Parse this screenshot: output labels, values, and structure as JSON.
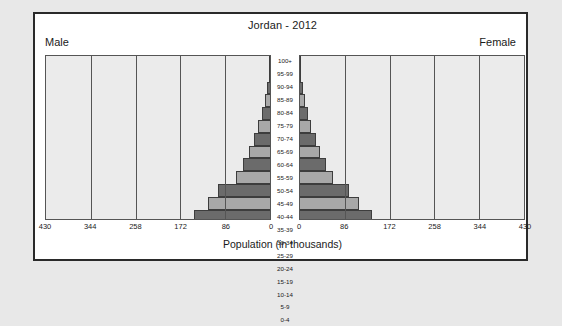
{
  "chart_data": {
    "type": "bar",
    "subtype": "population-pyramid",
    "title": "Jordan - 2012",
    "xlabel": "Population (in thousands)",
    "ylabel": "",
    "left_series_label": "Male",
    "right_series_label": "Female",
    "categories": [
      "100+",
      "95-99",
      "90-94",
      "85-89",
      "80-84",
      "75-79",
      "70-74",
      "65-69",
      "60-64",
      "55-59",
      "50-54",
      "45-49",
      "40-44",
      "35-39",
      "30-34",
      "25-29",
      "20-24",
      "15-19",
      "10-14",
      "5-9",
      "0-4"
    ],
    "xlim": [
      0,
      430
    ],
    "xticks": [
      0,
      86,
      172,
      258,
      344,
      430
    ],
    "xtick_labels_left": [
      "430",
      "344",
      "258",
      "172",
      "86",
      "0"
    ],
    "xtick_labels_right": [
      "0",
      "86",
      "172",
      "258",
      "344",
      "430"
    ],
    "grid": true,
    "legend_position": "none",
    "series": [
      {
        "name": "Male",
        "side": "left",
        "values": [
          1,
          2,
          5,
          9,
          16,
          23,
          31,
          40,
          52,
          66,
          99,
          120,
          145,
          166,
          190,
          213,
          250,
          288,
          310,
          330,
          383
        ]
      },
      {
        "name": "Female",
        "side": "right",
        "values": [
          1,
          2,
          5,
          9,
          15,
          22,
          30,
          38,
          50,
          63,
          95,
          114,
          138,
          158,
          182,
          204,
          240,
          276,
          297,
          316,
          366
        ]
      }
    ],
    "bar_colors": {
      "dark": "#6b6b6b",
      "light": "#a8a8a8",
      "outline": "#3d3d3d"
    },
    "panel_background": "#ebebeb",
    "figure_background": "#ffffff",
    "page_background": "#e8e8e8"
  }
}
